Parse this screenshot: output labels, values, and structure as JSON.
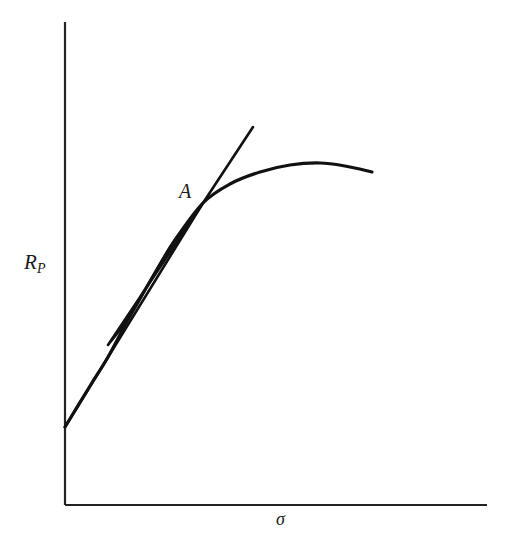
{
  "chart_data": {
    "type": "line",
    "title": "",
    "subtitle": "",
    "xlabel": "σ",
    "ylabel": "R_P",
    "ylabel_base": "R",
    "ylabel_sub": "P",
    "grid": false,
    "legend": null,
    "axis_ticks": {
      "x": [],
      "y": []
    },
    "xlim": [
      0,
      1
    ],
    "ylim": [
      0,
      1
    ],
    "axes": {
      "origin_px": [
        65,
        505
      ],
      "y_axis_top_px": [
        65,
        22
      ],
      "x_axis_right_px": [
        487,
        505
      ],
      "arrowheads": false,
      "color": "#222222",
      "line_width_px": 2
    },
    "series": [
      {
        "name": "efficient-frontier-curve",
        "kind": "curve",
        "style": "solid",
        "color": "#111111",
        "width_px": 3.2,
        "points_px": [
          [
            65,
            427
          ],
          [
            90,
            386
          ],
          [
            108,
            357
          ],
          [
            130,
            316
          ],
          [
            152,
            278
          ],
          [
            175,
            240
          ],
          [
            203,
            203
          ],
          [
            230,
            184
          ],
          [
            260,
            172
          ],
          [
            290,
            165
          ],
          [
            320,
            163
          ],
          [
            345,
            166
          ],
          [
            372,
            172
          ]
        ]
      },
      {
        "name": "tangent-line",
        "kind": "line",
        "style": "solid",
        "color": "#111111",
        "width_px": 2.6,
        "points_px": [
          [
            65,
            427
          ],
          [
            203,
            203
          ],
          [
            253,
            127
          ]
        ]
      }
    ],
    "annotations": [
      {
        "name": "tangency-point-label",
        "text": "A",
        "anchor_px": [
          203,
          203
        ],
        "label_px": [
          189,
          192
        ],
        "italic": true
      },
      {
        "name": "hatched-region",
        "text": "",
        "description": "hatched lens between tangent line and curve",
        "fill": "#111111",
        "hatch": "diagonal-white-stripes",
        "tip_lower_px": [
          108,
          345
        ],
        "tip_upper_px": [
          203,
          203
        ]
      }
    ]
  },
  "figure": {
    "background": "#ffffff",
    "ink_color": "#111111",
    "y_axis_label": "R",
    "y_axis_label_sub": "P",
    "x_axis_label": "σ",
    "point_a_label": "A"
  }
}
